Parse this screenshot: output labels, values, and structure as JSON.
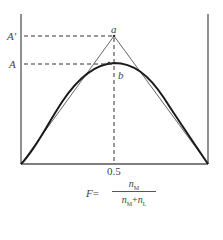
{
  "diagram": {
    "labels": {
      "a_prime": "A'",
      "a_level": "A",
      "apex": "a",
      "curve_point": "b",
      "x_tick": "0.5"
    },
    "formula": {
      "lhs": "F",
      "equals": "=",
      "numerator": "n",
      "numerator_sub": "M",
      "denominator_1": "n",
      "denominator_1_sub": "M",
      "plus": "+",
      "denominator_2": "n",
      "denominator_2_sub": "L"
    },
    "colors": {
      "axis": "#555555",
      "triangle": "#666666",
      "curve": "#1a1a1a",
      "dashed": "#333333"
    }
  }
}
